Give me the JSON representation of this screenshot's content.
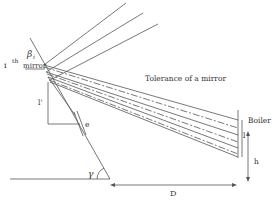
{
  "diagram": {
    "labels": {
      "mirror_index": "i",
      "mirror_sup": "th",
      "mirror_word": "mirror",
      "beta": "β",
      "beta_sub": "i",
      "tolerance": "Tolerance of a mirror",
      "boiler": "Boiler",
      "l": "l",
      "l_prime": "l'",
      "h": "h",
      "e": "e",
      "gamma": "γ",
      "D": "D"
    },
    "incident_ray_count": 3,
    "reflected_beam_line_count": 7
  }
}
